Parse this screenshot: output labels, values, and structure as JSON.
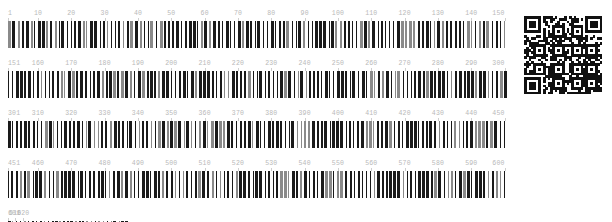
{
  "caption": {
    "text": ""
  },
  "colors": {
    "bar": "#1a1a1a",
    "bar_light": "#8a8a8a",
    "ruler_label": "#b9b9b9",
    "ruler_tick": "#cfcfcf",
    "qr_module": "#111111",
    "background": "#ffffff"
  },
  "viewer": {
    "sequence_start": 1,
    "sequence_end": 620,
    "bases_per_row": 150,
    "row_count": 5,
    "tick_interval": 10
  },
  "rows": [
    {
      "id": "row-1",
      "start": 1,
      "end": 150,
      "width_px": 500,
      "labels": [
        "1",
        "10",
        "20",
        "30",
        "40",
        "50",
        "60",
        "70",
        "80",
        "90",
        "100",
        "110",
        "120",
        "130",
        "140",
        "150"
      ],
      "label_positions": [
        1,
        10,
        20,
        30,
        40,
        50,
        60,
        70,
        80,
        90,
        100,
        110,
        120,
        130,
        140,
        150
      ],
      "bar_pattern": "210112212122111221211212211122121121221112212211211212112212112221211211221221121212211221212112112212212112211212211221121122121221121211221211212212112121221121122121211212212112221121121212212112211221212112112212121221211221121212112212211212"
    },
    {
      "id": "row-2",
      "start": 151,
      "end": 300,
      "width_px": 500,
      "labels": [
        "151",
        "160",
        "170",
        "180",
        "190",
        "200",
        "210",
        "220",
        "230",
        "240",
        "250",
        "260",
        "270",
        "280",
        "290",
        "300"
      ],
      "label_positions": [
        151,
        160,
        170,
        180,
        190,
        200,
        210,
        220,
        230,
        240,
        250,
        260,
        270,
        280,
        290,
        300
      ],
      "bar_pattern": "121221211221122112121122121112212112212211212212112121122121211221221121121221211212212112211221212121122112122112121221121122112212112121221211221121212112211212212112112212211221121212211211221212112122112121122121121221221121211221211212212121"
    },
    {
      "id": "row-3",
      "start": 301,
      "end": 450,
      "width_px": 500,
      "labels": [
        "301",
        "310",
        "320",
        "330",
        "340",
        "350",
        "360",
        "370",
        "380",
        "390",
        "400",
        "410",
        "420",
        "430",
        "440",
        "450"
      ],
      "label_positions": [
        301,
        310,
        320,
        330,
        340,
        350,
        360,
        370,
        380,
        390,
        400,
        410,
        420,
        430,
        440,
        450
      ],
      "bar_pattern": "211212122112211212212112121122121221121122121121221221121211221211212212112122112121221121121221211221212112211212212121122112122112211212112212112121221211221121212211211221221121121212212112211221212112121122121221121122121121221121211221221212"
    },
    {
      "id": "row-4",
      "start": 451,
      "end": 600,
      "width_px": 500,
      "labels": [
        "451",
        "460",
        "470",
        "480",
        "490",
        "500",
        "510",
        "520",
        "530",
        "540",
        "550",
        "560",
        "570",
        "580",
        "590",
        "600"
      ],
      "label_positions": [
        451,
        460,
        470,
        480,
        490,
        500,
        510,
        520,
        530,
        540,
        550,
        560,
        570,
        580,
        590,
        600
      ],
      "bar_pattern": "112212121122112121221211221121212211211221221121121212211221211212212112211212122112121122121121221221121211221211212212112122112211212121122112122112211221212112112212211221121212112212112121221211221121212211212212112112212121122121121221211212"
    },
    {
      "id": "row-5",
      "start": 601,
      "end": 620,
      "width_px": 120,
      "labels": [
        "601",
        "610",
        "620"
      ],
      "label_positions": [
        601,
        610,
        620
      ],
      "bar_pattern": "2112121221122112211212212112121122121121221211221212112211212"
    }
  ],
  "qr": {
    "label": "qr-code",
    "modules": 33,
    "has_finder_patterns": true,
    "finder_corners": [
      "top-left",
      "top-right",
      "bottom-left"
    ]
  }
}
